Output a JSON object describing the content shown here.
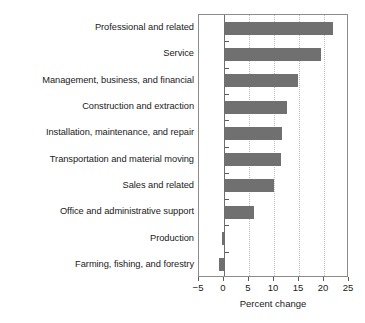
{
  "chart_data": {
    "type": "bar",
    "orientation": "horizontal",
    "title": "",
    "xlabel": "Percent change",
    "ylabel": "",
    "xlim": [
      -5,
      25
    ],
    "xticks": [
      -5,
      0,
      5,
      10,
      15,
      20,
      25
    ],
    "xtick_labels": [
      "−5",
      "0",
      "5",
      "10",
      "15",
      "20",
      "25"
    ],
    "gridlines": [
      5,
      10,
      15,
      20
    ],
    "grid": true,
    "legend": null,
    "bar_color": "#707070",
    "frame_color": "#8c8c8c",
    "gridline_color": "#bdbdbd",
    "categories": [
      "Professional and related",
      "Service",
      "Management, business, and financial",
      "Construction and extraction",
      "Installation, maintenance, and repair",
      "Transportation and material moving",
      "Sales and related",
      "Office and administrative support",
      "Production",
      "Farming, fishing, and forestry"
    ],
    "values": [
      21.6,
      19.2,
      14.5,
      12.4,
      11.3,
      11.1,
      9.8,
      5.8,
      -0.4,
      -1.1
    ]
  }
}
